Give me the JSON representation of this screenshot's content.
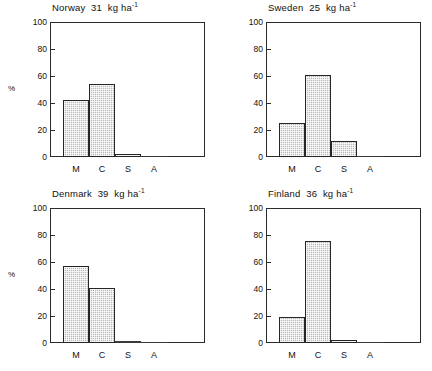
{
  "chart_data": {
    "type": "bar",
    "title": "",
    "xlabel": "",
    "ylabel": "%",
    "ylim": [
      0,
      100
    ],
    "yticks": [
      0,
      20,
      40,
      60,
      80,
      100
    ],
    "grid": false,
    "legend": null,
    "categories": [
      "M",
      "C",
      "S",
      "A"
    ],
    "panels": [
      {
        "country": "Norway",
        "rate_value": "31",
        "rate_units": "kg ha",
        "rate_exponent": "-1",
        "title": "Norway  31  kg ha-1",
        "ylabel": "%",
        "values": [
          42,
          54,
          2.5,
          0.6
        ]
      },
      {
        "country": "Sweden",
        "rate_value": "25",
        "rate_units": "kg ha",
        "rate_exponent": "-1",
        "title": "Sweden  25  kg ha-1",
        "ylabel": "",
        "values": [
          25,
          61,
          11.5,
          0.3
        ]
      },
      {
        "country": "Denmark",
        "rate_value": "39",
        "rate_units": "kg ha",
        "rate_exponent": "-1",
        "title": "Denmark  39  kg ha-1",
        "ylabel": "%",
        "values": [
          57,
          40.5,
          1.5,
          0.3
        ]
      },
      {
        "country": "Finland",
        "rate_value": "36",
        "rate_units": "kg ha",
        "rate_exponent": "-1",
        "title": "Finland  36  kg ha-1",
        "ylabel": "",
        "values": [
          19.5,
          75.5,
          2.0,
          0.6
        ]
      }
    ]
  },
  "panels": {
    "norway": {
      "country": "Norway",
      "rate": "31",
      "units": "kg ha",
      "exponent": "-1",
      "ylabel": "%"
    },
    "sweden": {
      "country": "Sweden",
      "rate": "25",
      "units": "kg ha",
      "exponent": "-1",
      "ylabel": ""
    },
    "denmark": {
      "country": "Denmark",
      "rate": "39",
      "units": "kg ha",
      "exponent": "-1",
      "ylabel": "%"
    },
    "finland": {
      "country": "Finland",
      "rate": "36",
      "units": "kg ha",
      "exponent": "-1",
      "ylabel": "%"
    }
  },
  "axis": {
    "yticks": [
      "0",
      "20",
      "40",
      "60",
      "80",
      "100"
    ],
    "xticks": [
      "M",
      "C",
      "S",
      "A"
    ]
  }
}
